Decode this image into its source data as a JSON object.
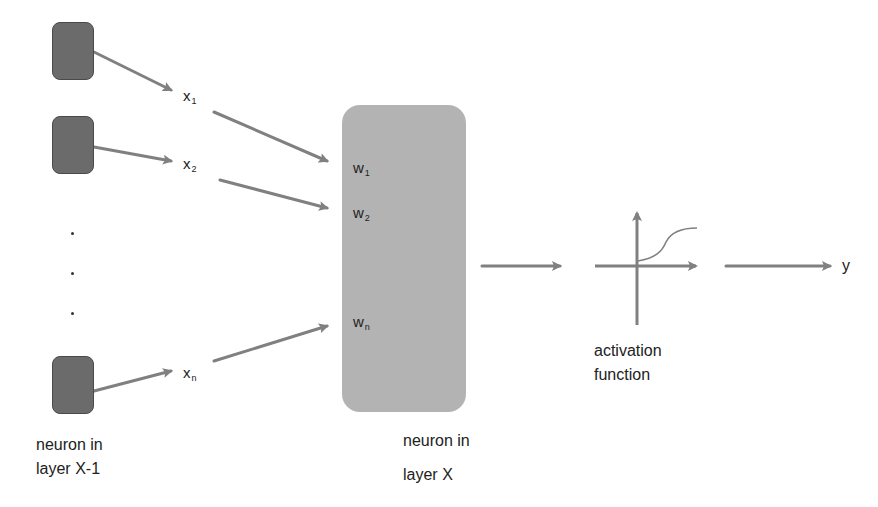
{
  "diagram": {
    "type": "artificial-neuron",
    "colors": {
      "source_neuron_fill": "#6b6b6b",
      "target_neuron_fill": "#b3b3b3",
      "arrow": "#808080",
      "text": "#222222"
    },
    "source_neurons": {
      "caption_line1": "neuron in",
      "caption_line2": "layer X-1",
      "ellipsis": "..."
    },
    "inputs": [
      {
        "base": "x",
        "sub": "1"
      },
      {
        "base": "x",
        "sub": "2"
      },
      {
        "base": "x",
        "sub": "n"
      }
    ],
    "weights": [
      {
        "base": "w",
        "sub": "1"
      },
      {
        "base": "w",
        "sub": "2"
      },
      {
        "base": "w",
        "sub": "n"
      }
    ],
    "target_neuron": {
      "caption_line1": "neuron in",
      "caption_line2": "layer X"
    },
    "activation": {
      "caption_line1": "activation",
      "caption_line2": "function",
      "icon": "sigmoid-plot-icon"
    },
    "output": {
      "label": "y"
    }
  }
}
